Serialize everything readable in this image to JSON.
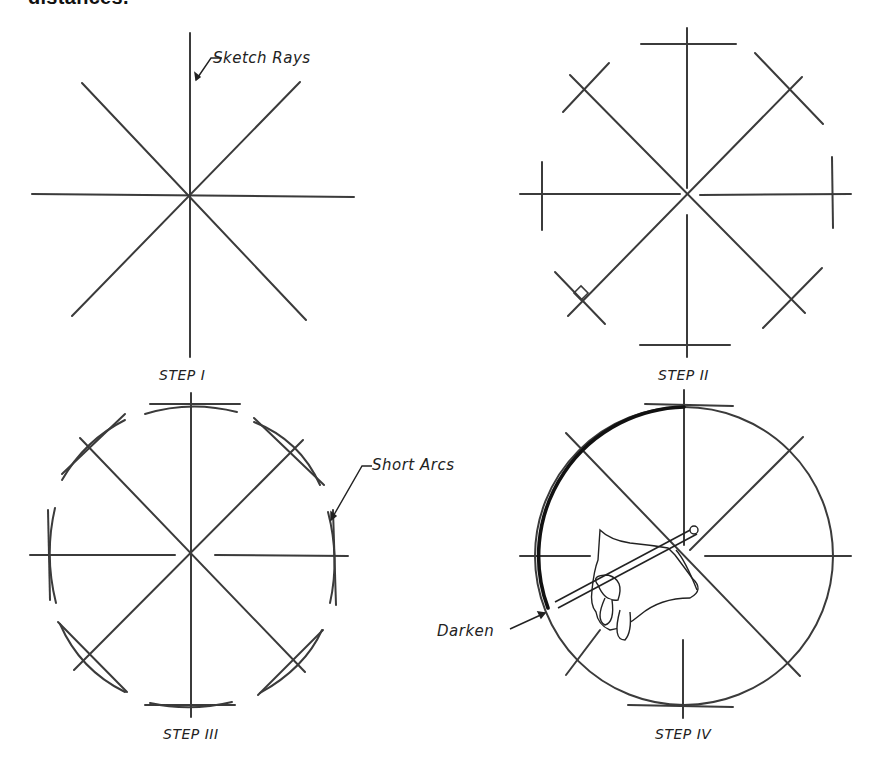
{
  "header": {
    "fragment_text": "distances."
  },
  "figures": [
    {
      "id": "step-1",
      "label": "STEP I",
      "annotation": "Sketch Rays"
    },
    {
      "id": "step-2",
      "label": "STEP II"
    },
    {
      "id": "step-3",
      "label": "STEP III",
      "annotation": "Short Arcs"
    },
    {
      "id": "step-4",
      "label": "STEP IV",
      "annotation": "Darken"
    }
  ],
  "colors": {
    "line": "#3a3a3a",
    "dark_line": "#111111",
    "background": "#ffffff"
  }
}
